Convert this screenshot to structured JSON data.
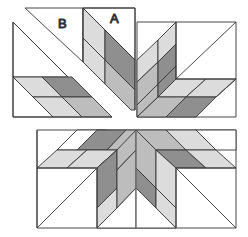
{
  "labels": {
    "piece_a": "A",
    "piece_b": "B"
  },
  "colors": {
    "background": "#ffffff",
    "outline": "#333333",
    "light": "#dcdcdc",
    "medium": "#bdbdbd",
    "dark": "#8f8f8f",
    "white": "#ffffff"
  },
  "sections": [
    {
      "name": "top-left-unit",
      "description": "corner square with separated triangle B and strip A"
    },
    {
      "name": "top-right-unit",
      "description": "corner square with diamond rows"
    },
    {
      "name": "bottom-unit",
      "description": "half star row with center star points"
    }
  ]
}
